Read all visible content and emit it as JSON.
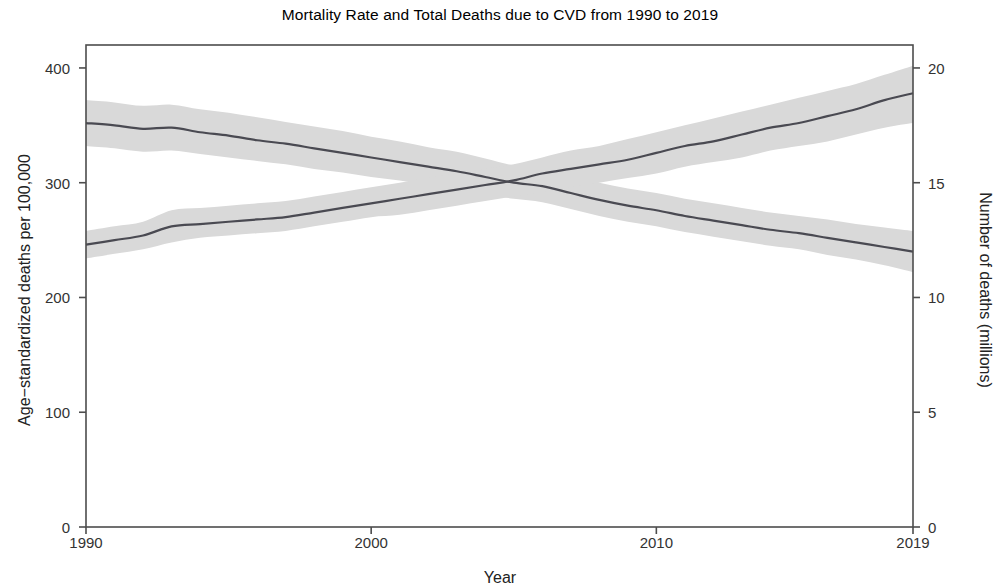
{
  "chart_data": {
    "type": "line",
    "title": "Mortality Rate and Total Deaths due to CVD from 1990 to 2019",
    "xlabel": "Year",
    "ylabel_left": "Age−standardized deaths per 100,000",
    "ylabel_right": "Number of deaths (millions)",
    "xlim": [
      1990,
      2019
    ],
    "ylim_left": [
      0,
      420
    ],
    "ylim_right": [
      0,
      21
    ],
    "xticks": [
      1990,
      2000,
      2010,
      2019
    ],
    "xtick_labels": [
      "1990",
      "2000",
      "2010",
      "2019"
    ],
    "yticks_left": [
      0,
      100,
      200,
      300,
      400
    ],
    "ytick_labels_left": [
      "0",
      "100",
      "200",
      "300",
      "400"
    ],
    "yticks_right": [
      0,
      5,
      10,
      15,
      20
    ],
    "ytick_labels_right": [
      "0",
      "5",
      "10",
      "15",
      "20"
    ],
    "grid": false,
    "legend": "none",
    "line_color": "#4a4a52",
    "band_color": "#d9d9d9",
    "panel_border_color": "#4d4d4d",
    "background": "#ffffff",
    "x": [
      1990,
      1991,
      1992,
      1993,
      1994,
      1995,
      1996,
      1997,
      1998,
      1999,
      2000,
      2001,
      2002,
      2003,
      2004,
      2005,
      2006,
      2007,
      2008,
      2009,
      2010,
      2011,
      2012,
      2013,
      2014,
      2015,
      2016,
      2017,
      2018,
      2019
    ],
    "series": [
      {
        "name": "Age-standardized mortality rate (per 100,000)",
        "axis": "left",
        "values": [
          352,
          350,
          347,
          348,
          344,
          341,
          337,
          334,
          330,
          326,
          322,
          318,
          314,
          310,
          305,
          300,
          297,
          291,
          285,
          280,
          276,
          271,
          267,
          263,
          259,
          256,
          252,
          248,
          244,
          240
        ],
        "ci_lower": [
          332,
          330,
          327,
          328,
          325,
          322,
          319,
          316,
          312,
          309,
          305,
          302,
          298,
          294,
          290,
          286,
          283,
          277,
          271,
          266,
          262,
          257,
          253,
          249,
          245,
          242,
          237,
          233,
          228,
          222
        ],
        "ci_upper": [
          372,
          370,
          367,
          368,
          364,
          361,
          357,
          353,
          349,
          345,
          340,
          336,
          331,
          327,
          321,
          315,
          312,
          306,
          300,
          295,
          291,
          286,
          282,
          278,
          274,
          271,
          268,
          264,
          261,
          258
        ]
      },
      {
        "name": "Total deaths (millions)",
        "axis": "right",
        "values": [
          12.3,
          12.5,
          12.7,
          13.1,
          13.2,
          13.3,
          13.4,
          13.5,
          13.7,
          13.9,
          14.1,
          14.3,
          14.5,
          14.7,
          14.9,
          15.1,
          15.4,
          15.6,
          15.8,
          16.0,
          16.3,
          16.6,
          16.8,
          17.1,
          17.4,
          17.6,
          17.9,
          18.2,
          18.6,
          18.9
        ],
        "ci_lower": [
          11.7,
          11.9,
          12.1,
          12.4,
          12.6,
          12.7,
          12.8,
          12.9,
          13.1,
          13.3,
          13.5,
          13.6,
          13.8,
          14.0,
          14.2,
          14.4,
          14.6,
          14.8,
          15.0,
          15.2,
          15.4,
          15.7,
          15.9,
          16.1,
          16.4,
          16.6,
          16.8,
          17.1,
          17.4,
          17.6
        ],
        "ci_upper": [
          12.9,
          13.1,
          13.3,
          13.8,
          13.9,
          14.0,
          14.1,
          14.2,
          14.4,
          14.6,
          14.8,
          15.0,
          15.2,
          15.4,
          15.6,
          15.8,
          16.1,
          16.4,
          16.6,
          16.9,
          17.2,
          17.5,
          17.8,
          18.1,
          18.4,
          18.7,
          19.0,
          19.3,
          19.7,
          20.1
        ]
      }
    ],
    "annotations": []
  }
}
